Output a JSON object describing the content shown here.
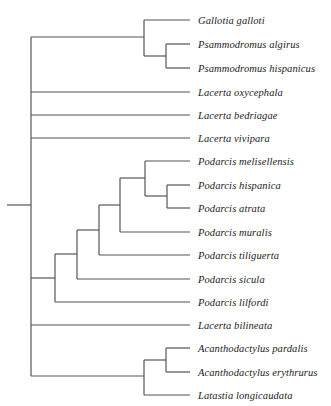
{
  "figure": {
    "type": "phylogenetic-cladogram",
    "title": "",
    "orientation": "left-to-right",
    "style": {
      "line_color": "#555555",
      "line_width": 1.2,
      "background": "#ffffff",
      "label_color": "#1a1a1a"
    },
    "canvas": {
      "width": 331,
      "height": 406
    }
  },
  "tree": {
    "root": {
      "x": 7,
      "y": 205,
      "trunk_x": 31
    },
    "tip_x": 190,
    "label_x": 198,
    "taxa": [
      {
        "id": "gallotia-galloti",
        "label": "Gallotia galloti",
        "y": 20,
        "branch_x": 144
      },
      {
        "id": "psammodromus-algirus",
        "label": "Psammodromus algirus",
        "y": 44,
        "branch_x": 166
      },
      {
        "id": "psammodromus-hispanicus",
        "label": "Psammodromus hispanicus",
        "y": 68,
        "branch_x": 166
      },
      {
        "id": "lacerta-oxycephala",
        "label": "Lacerta oxycephala",
        "y": 92,
        "branch_x": 31
      },
      {
        "id": "lacerta-bedriagae",
        "label": "Lacerta bedriagae",
        "y": 115,
        "branch_x": 31
      },
      {
        "id": "lacerta-vivipara",
        "label": "Lacerta vivipara",
        "y": 138,
        "branch_x": 31
      },
      {
        "id": "podarcis-melisellensis",
        "label": "Podarcis melisellensis",
        "y": 161,
        "branch_x": 145
      },
      {
        "id": "podarcis-hispanica",
        "label": "Podarcis hispanica",
        "y": 185,
        "branch_x": 167
      },
      {
        "id": "podarcis-atrata",
        "label": "Podarcis atrata",
        "y": 208,
        "branch_x": 167
      },
      {
        "id": "podarcis-muralis",
        "label": "Podarcis muralis",
        "y": 232,
        "branch_x": 120
      },
      {
        "id": "podarcis-tiliguerta",
        "label": "Podarcis tiliguerta",
        "y": 255,
        "branch_x": 99
      },
      {
        "id": "podarcis-sicula",
        "label": "Podarcis sicula",
        "y": 279,
        "branch_x": 77
      },
      {
        "id": "podarcis-lilfordi",
        "label": "Podarcis lilfordi",
        "y": 302,
        "branch_x": 55
      },
      {
        "id": "lacerta-bilineata",
        "label": "Lacerta bilineata",
        "y": 325,
        "branch_x": 31
      },
      {
        "id": "acanthodactylus-pardalis",
        "label": "Acanthodactylus pardalis",
        "y": 348,
        "branch_x": 166
      },
      {
        "id": "acanthodactylus-erythrurus",
        "label": "Acanthodactylus erythrurus",
        "y": 372,
        "branch_x": 166
      },
      {
        "id": "latastia-longicaudata",
        "label": "Latastia longicaudata",
        "y": 395,
        "branch_x": 144
      }
    ],
    "internal_nodes": [
      {
        "id": "node-root",
        "x": 31,
        "y_top": 37,
        "y_bottom": 376
      },
      {
        "id": "node-gallotia-psammodromus",
        "x": 144,
        "y_top": 20,
        "y_bottom": 56
      },
      {
        "id": "node-psammodromus",
        "x": 166,
        "y_top": 44,
        "y_bottom": 68
      },
      {
        "id": "node-podarcis-top3",
        "x": 145,
        "y_top": 161,
        "y_bottom": 196
      },
      {
        "id": "node-podarcis-hisp-atrata",
        "x": 167,
        "y_top": 185,
        "y_bottom": 208
      },
      {
        "id": "node-podarcis-muralis",
        "x": 120,
        "y_top": 178,
        "y_bottom": 232
      },
      {
        "id": "node-podarcis-tiliguerta",
        "x": 99,
        "y_top": 205,
        "y_bottom": 255
      },
      {
        "id": "node-podarcis-sicula",
        "x": 77,
        "y_top": 230,
        "y_bottom": 279
      },
      {
        "id": "node-podarcis-lilfordi",
        "x": 55,
        "y_top": 254,
        "y_bottom": 302
      },
      {
        "id": "node-lacertid-outgroup",
        "x": 144,
        "y_top": 360,
        "y_bottom": 395
      },
      {
        "id": "node-acanthodactylus",
        "x": 166,
        "y_top": 348,
        "y_bottom": 372
      }
    ],
    "horizontal_branches": [
      {
        "id": "branch-root-stub",
        "x1": 7,
        "x2": 31,
        "y": 205
      },
      {
        "id": "branch-to-gallotia-clade",
        "x1": 31,
        "x2": 144,
        "y": 37
      },
      {
        "id": "branch-gallotia-galloti",
        "x1": 144,
        "x2": 190,
        "y": 20
      },
      {
        "id": "branch-to-psammodromus-node",
        "x1": 144,
        "x2": 166,
        "y": 56
      },
      {
        "id": "branch-psammodromus-algirus",
        "x1": 166,
        "x2": 190,
        "y": 44
      },
      {
        "id": "branch-psammodromus-hispanicus",
        "x1": 166,
        "x2": 190,
        "y": 68
      },
      {
        "id": "branch-lacerta-oxycephala",
        "x1": 31,
        "x2": 190,
        "y": 92
      },
      {
        "id": "branch-lacerta-bedriagae",
        "x1": 31,
        "x2": 190,
        "y": 115
      },
      {
        "id": "branch-lacerta-vivipara",
        "x1": 31,
        "x2": 190,
        "y": 138
      },
      {
        "id": "branch-podarcis-melisellensis",
        "x1": 145,
        "x2": 190,
        "y": 161
      },
      {
        "id": "branch-to-hisp-atrata-node",
        "x1": 145,
        "x2": 167,
        "y": 196
      },
      {
        "id": "branch-podarcis-hispanica",
        "x1": 167,
        "x2": 190,
        "y": 185
      },
      {
        "id": "branch-podarcis-atrata",
        "x1": 167,
        "x2": 190,
        "y": 208
      },
      {
        "id": "branch-to-podarcis-top3",
        "x1": 120,
        "x2": 145,
        "y": 178
      },
      {
        "id": "branch-podarcis-muralis",
        "x1": 120,
        "x2": 190,
        "y": 232
      },
      {
        "id": "branch-to-muralis-node",
        "x1": 99,
        "x2": 120,
        "y": 205
      },
      {
        "id": "branch-podarcis-tiliguerta",
        "x1": 99,
        "x2": 190,
        "y": 255
      },
      {
        "id": "branch-to-tiliguerta-node",
        "x1": 77,
        "x2": 99,
        "y": 230
      },
      {
        "id": "branch-podarcis-sicula",
        "x1": 77,
        "x2": 190,
        "y": 279
      },
      {
        "id": "branch-to-sicula-node",
        "x1": 55,
        "x2": 77,
        "y": 254
      },
      {
        "id": "branch-podarcis-lilfordi",
        "x1": 55,
        "x2": 190,
        "y": 302
      },
      {
        "id": "branch-to-lilfordi-node",
        "x1": 31,
        "x2": 55,
        "y": 278
      },
      {
        "id": "branch-lacerta-bilineata",
        "x1": 31,
        "x2": 190,
        "y": 325
      },
      {
        "id": "branch-to-outgroup-clade",
        "x1": 31,
        "x2": 144,
        "y": 376
      },
      {
        "id": "branch-to-acanthodactylus-node",
        "x1": 144,
        "x2": 166,
        "y": 360
      },
      {
        "id": "branch-acanthodactylus-pardalis",
        "x1": 166,
        "x2": 190,
        "y": 348
      },
      {
        "id": "branch-acanthodactylus-erythrurus",
        "x1": 166,
        "x2": 190,
        "y": 372
      },
      {
        "id": "branch-latastia-longicaudata",
        "x1": 144,
        "x2": 190,
        "y": 395
      }
    ]
  }
}
